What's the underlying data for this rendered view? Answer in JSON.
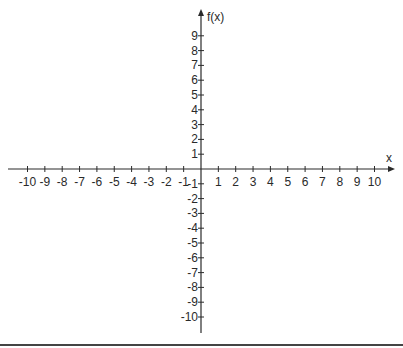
{
  "chart_data": {
    "type": "line",
    "title": "",
    "xlabel": "x",
    "ylabel": "f(x)",
    "xlim": [
      -10,
      10
    ],
    "ylim": [
      -10,
      9
    ],
    "x_ticks": [
      -10,
      -9,
      -8,
      -7,
      -6,
      -5,
      -4,
      -3,
      -2,
      -1,
      1,
      2,
      3,
      4,
      5,
      6,
      7,
      8,
      9,
      10
    ],
    "y_ticks": [
      9,
      8,
      7,
      6,
      5,
      4,
      3,
      2,
      1,
      -1,
      -2,
      -3,
      -4,
      -5,
      -6,
      -7,
      -8,
      -9,
      -10
    ],
    "series": [],
    "grid": false,
    "legend": null
  },
  "colors": {
    "axis": "#2a2a2a",
    "bottom_rule": "#444444",
    "background": "#ffffff"
  }
}
